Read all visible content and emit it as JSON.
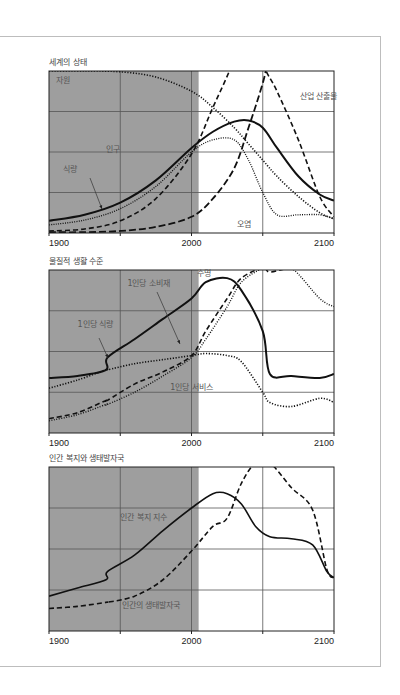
{
  "figure": {
    "panels": [
      {
        "id": "state",
        "title": "세계의 상태"
      },
      {
        "id": "living",
        "title": "물질적 생활 수준"
      },
      {
        "id": "welfare",
        "title": "인간 복지와 생태발자국"
      }
    ],
    "x_ticks": [
      "1900",
      "2000",
      "2100"
    ],
    "colors": {
      "shade": "#9e9e9e",
      "grid": "#555555",
      "line": "#111111",
      "label": "#5a5a5a"
    }
  },
  "chart_data": [
    {
      "type": "line",
      "title": "세계의 상태",
      "xlabel": "",
      "ylabel": "",
      "xlim": [
        1900,
        2100
      ],
      "ylim": [
        0,
        4
      ],
      "grid": true,
      "shaded_region": [
        1900,
        2005
      ],
      "x": [
        1900,
        1925,
        1950,
        1975,
        2000,
        2015,
        2030,
        2040,
        2050,
        2060,
        2075,
        2090,
        2100
      ],
      "series": [
        {
          "name": "자원",
          "style": "dotted",
          "values": [
            4.0,
            4.0,
            3.98,
            3.85,
            3.5,
            3.1,
            2.6,
            2.2,
            1.8,
            1.4,
            0.9,
            0.5,
            0.35
          ]
        },
        {
          "name": "인구",
          "style": "solid-thick",
          "values": [
            0.3,
            0.45,
            0.75,
            1.3,
            2.1,
            2.5,
            2.75,
            2.78,
            2.6,
            2.1,
            1.4,
            0.95,
            0.8
          ]
        },
        {
          "name": "식량",
          "style": "dotted-fine",
          "values": [
            0.2,
            0.32,
            0.6,
            1.15,
            2.0,
            2.3,
            2.3,
            1.8,
            1.0,
            0.45,
            0.45,
            0.45,
            0.35
          ]
        },
        {
          "name": "산업 산출물",
          "style": "dashed",
          "values": [
            0.05,
            0.1,
            0.3,
            0.85,
            1.95,
            3.1,
            4.3,
            5.5,
            4.2,
            3.5,
            2.3,
            0.9,
            0.4
          ]
        },
        {
          "name": "오염",
          "style": "long-dash",
          "values": [
            0.02,
            0.02,
            0.05,
            0.15,
            0.4,
            0.85,
            1.6,
            2.6,
            3.7,
            5.0,
            5.0,
            5.0,
            5.0
          ]
        }
      ],
      "annotations": [
        {
          "text": "자원",
          "x": 1905,
          "y": 3.7
        },
        {
          "text": "인구",
          "x": 1940,
          "y": 2.0
        },
        {
          "text": "식량",
          "x": 1910,
          "y": 1.5
        },
        {
          "text": "산업 산출물",
          "x": 2076,
          "y": 3.3
        },
        {
          "text": "오염",
          "x": 2032,
          "y": 0.15
        }
      ]
    },
    {
      "type": "line",
      "title": "물질적 생활 수준",
      "xlabel": "",
      "ylabel": "",
      "xlim": [
        1900,
        2100
      ],
      "ylim": [
        0,
        4
      ],
      "grid": true,
      "shaded_region": [
        1900,
        2005
      ],
      "x": [
        1900,
        1920,
        1940,
        1941,
        1960,
        1980,
        2000,
        2010,
        2025,
        2035,
        2050,
        2055,
        2070,
        2090,
        2100
      ],
      "series": [
        {
          "name": "1인당 소비재",
          "style": "solid-thick",
          "values": [
            1.35,
            1.4,
            1.55,
            1.85,
            2.3,
            2.8,
            3.3,
            3.7,
            3.8,
            3.5,
            2.5,
            1.45,
            1.4,
            1.35,
            1.45
          ]
        },
        {
          "name": "1인당 식량",
          "style": "dotted",
          "values": [
            1.1,
            1.3,
            1.55,
            1.55,
            1.7,
            1.8,
            1.9,
            1.95,
            1.9,
            1.75,
            1.0,
            0.75,
            0.65,
            0.85,
            0.75
          ]
        },
        {
          "name": "1인당 서비스",
          "style": "dashed",
          "values": [
            0.35,
            0.5,
            0.8,
            0.8,
            1.2,
            1.5,
            1.9,
            2.5,
            3.3,
            3.8,
            4.05,
            3.95,
            4.05,
            4.05,
            4.05
          ]
        },
        {
          "name": "수명",
          "style": "dotted-dense",
          "values": [
            0.3,
            0.45,
            0.7,
            0.7,
            1.0,
            1.4,
            1.85,
            2.3,
            3.1,
            3.7,
            4.05,
            4.05,
            4.05,
            3.3,
            3.1
          ]
        }
      ],
      "annotations": [
        {
          "text": "수명",
          "x": 2004,
          "y": 3.85
        },
        {
          "text": "1인당 소비재",
          "x": 1955,
          "y": 3.6
        },
        {
          "text": "1인당 식량",
          "x": 1920,
          "y": 2.6
        },
        {
          "text": "1인당 서비스",
          "x": 1985,
          "y": 1.05
        }
      ]
    },
    {
      "type": "line",
      "title": "인간 복지와 생태발자국",
      "xlabel": "",
      "ylabel": "",
      "xlim": [
        1900,
        2100
      ],
      "ylim": [
        0,
        4
      ],
      "grid": true,
      "shaded_region": [
        1900,
        2005
      ],
      "x": [
        1900,
        1920,
        1940,
        1941,
        1960,
        1980,
        2000,
        2015,
        2025,
        2035,
        2045,
        2055,
        2070,
        2085,
        2095,
        2100
      ],
      "series": [
        {
          "name": "인간 복지 지수",
          "style": "solid",
          "values": [
            0.85,
            1.05,
            1.25,
            1.45,
            1.85,
            2.45,
            3.0,
            3.35,
            3.35,
            3.1,
            2.55,
            2.3,
            2.25,
            2.1,
            1.45,
            1.3
          ]
        },
        {
          "name": "인간의 생태발자국",
          "style": "dashed",
          "values": [
            0.55,
            0.6,
            0.7,
            0.7,
            0.85,
            1.25,
            1.95,
            2.55,
            2.75,
            3.6,
            4.1,
            4.1,
            3.5,
            2.95,
            1.5,
            1.3
          ]
        }
      ],
      "annotations": [
        {
          "text": "인간 복지 지수",
          "x": 1950,
          "y": 2.7
        },
        {
          "text": "인간의 생태발자국",
          "x": 1951,
          "y": 0.55
        }
      ]
    }
  ]
}
